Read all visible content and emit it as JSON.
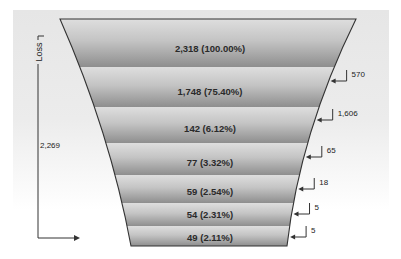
{
  "chart_data": {
    "type": "funnel",
    "title": "",
    "axis": {
      "label": "Loss",
      "total_loss_label": "2,269"
    },
    "stages": [
      {
        "value": 2318,
        "label": "2,318 (100.00%)",
        "percent": 100.0
      },
      {
        "value": 1748,
        "label": "1,748 (75.40%)",
        "percent": 75.4
      },
      {
        "value": 142,
        "label": "142 (6.12%)",
        "percent": 6.12
      },
      {
        "value": 77,
        "label": "77 (3.32%)",
        "percent": 3.32
      },
      {
        "value": 59,
        "label": "59 (2.54%)",
        "percent": 2.54
      },
      {
        "value": 54,
        "label": "54 (2.31%)",
        "percent": 2.31
      },
      {
        "value": 49,
        "label": "49 (2.11%)",
        "percent": 2.11
      }
    ],
    "losses": [
      {
        "value": 570,
        "label": "570"
      },
      {
        "value": 1606,
        "label": "1,606"
      },
      {
        "value": 65,
        "label": "65"
      },
      {
        "value": 18,
        "label": "18"
      },
      {
        "value": 5,
        "label": "5"
      },
      {
        "value": 5,
        "label": "5"
      }
    ],
    "total_loss": 2269,
    "colors": {
      "segment_top": "#dcdcdc",
      "segment_bottom": "#8f8f8f",
      "outline": "#333333",
      "panel": "#e8e8e8"
    },
    "grid": false,
    "legend": "none"
  }
}
